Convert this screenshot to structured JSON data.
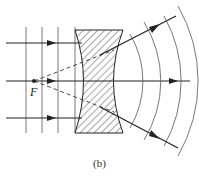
{
  "figure": {
    "caption": "(b)",
    "focal_point_label": "F",
    "elements": {
      "lens": {
        "type": "biconcave",
        "fill": "hatched"
      },
      "incoming_rays": 3,
      "plane_wavefronts": 4,
      "spherical_wavefronts": 4,
      "virtual_ray_style": "dashed"
    },
    "colors": {
      "line": "#222222",
      "background": "#ffffff"
    }
  }
}
